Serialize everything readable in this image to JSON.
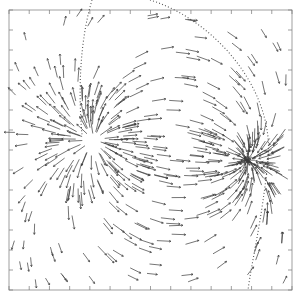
{
  "chart_data": {
    "type": "scatter",
    "subtype": "vector-field",
    "title": "",
    "xlabel": "",
    "ylabel": "",
    "legend": [],
    "grid": false,
    "frame": {
      "x0": 9,
      "y0": 10,
      "x1": 292,
      "y1": 290
    },
    "ticks": {
      "count_per_side": 14,
      "labels": []
    },
    "colors": {
      "vector": "#333333",
      "frame": "#555555",
      "curve": "#444444",
      "background": "#ffffff"
    },
    "features": [
      {
        "name": "dense-source-left",
        "cx": 95,
        "cy": 140,
        "description": "dense cluster of vectors radiating"
      },
      {
        "name": "dense-sink-right",
        "cx": 245,
        "cy": 160,
        "description": "dense converging vectors on right"
      },
      {
        "name": "dotted-boundary-curve",
        "description": "dotted arc from top-left near (90,0) bulging to right around x=265,y=150 and returning toward (250,290)"
      }
    ],
    "annotations": []
  }
}
